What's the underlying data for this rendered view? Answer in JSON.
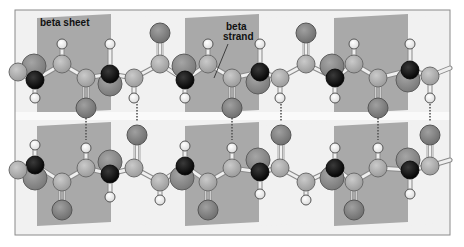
{
  "figure": {
    "labels": {
      "sheet": "beta sheet",
      "strand_line1": "beta",
      "strand_line2": "strand"
    },
    "colors": {
      "background": "#ffffff",
      "frame": "#8a8a8a",
      "panel_light": "#f1f1f1",
      "panel_dark": "#a9a9a9",
      "nitrogen": "#0d0d0d",
      "r_group": "#8e8e8e",
      "carbon": "#b4b4b4",
      "oxygen": "#8a8a8a",
      "hydrogen": "#fbfbfb",
      "bond": "#efefef",
      "hbond": "#555555"
    },
    "frame": {
      "x": 15,
      "y": 10,
      "width": 435,
      "height": 225
    },
    "panels": [
      {
        "x": 15,
        "y": 14,
        "w": 22,
        "h": 96,
        "shade": "light"
      },
      {
        "x": 37,
        "y": 14,
        "w": 74,
        "h": 96,
        "shade": "dark"
      },
      {
        "x": 111,
        "y": 14,
        "w": 74,
        "h": 96,
        "shade": "light"
      },
      {
        "x": 185,
        "y": 14,
        "w": 74,
        "h": 96,
        "shade": "dark"
      },
      {
        "x": 259,
        "y": 14,
        "w": 75,
        "h": 96,
        "shade": "light"
      },
      {
        "x": 334,
        "y": 14,
        "w": 74,
        "h": 96,
        "shade": "dark"
      },
      {
        "x": 408,
        "y": 14,
        "w": 42,
        "h": 96,
        "shade": "light"
      },
      {
        "x": 15,
        "y": 122,
        "w": 22,
        "h": 100,
        "shade": "light"
      },
      {
        "x": 37,
        "y": 122,
        "w": 74,
        "h": 100,
        "shade": "dark"
      },
      {
        "x": 111,
        "y": 122,
        "w": 74,
        "h": 100,
        "shade": "light"
      },
      {
        "x": 185,
        "y": 122,
        "w": 74,
        "h": 100,
        "shade": "dark"
      },
      {
        "x": 259,
        "y": 122,
        "w": 75,
        "h": 100,
        "shade": "light"
      },
      {
        "x": 334,
        "y": 122,
        "w": 74,
        "h": 100,
        "shade": "dark"
      },
      {
        "x": 408,
        "y": 122,
        "w": 42,
        "h": 100,
        "shade": "light"
      }
    ],
    "strands": [
      {
        "name": "top-strand",
        "backbone": [
          [
            15,
            72
          ],
          [
            35,
            80
          ],
          [
            62,
            64
          ],
          [
            86,
            78
          ],
          [
            110,
            74
          ],
          [
            134,
            78
          ],
          [
            160,
            64
          ],
          [
            185,
            80
          ],
          [
            208,
            64
          ],
          [
            232,
            78
          ],
          [
            260,
            72
          ],
          [
            280,
            78
          ],
          [
            306,
            64
          ],
          [
            335,
            78
          ],
          [
            354,
            64
          ],
          [
            378,
            78
          ],
          [
            410,
            70
          ],
          [
            430,
            76
          ],
          [
            450,
            68
          ]
        ],
        "nitrogens": [
          [
            35,
            80
          ],
          [
            110,
            74
          ],
          [
            185,
            80
          ],
          [
            260,
            72
          ],
          [
            335,
            78
          ],
          [
            410,
            70
          ]
        ],
        "r_groups": [
          [
            34,
            66
          ],
          [
            110,
            84
          ],
          [
            184,
            66
          ],
          [
            258,
            82
          ],
          [
            332,
            66
          ],
          [
            408,
            80
          ]
        ],
        "carbons": [
          [
            18,
            72
          ],
          [
            62,
            64
          ],
          [
            86,
            78
          ],
          [
            134,
            78
          ],
          [
            160,
            64
          ],
          [
            208,
            64
          ],
          [
            232,
            78
          ],
          [
            280,
            78
          ],
          [
            306,
            64
          ],
          [
            354,
            64
          ],
          [
            378,
            78
          ],
          [
            430,
            76
          ]
        ],
        "oxygens": [
          [
            160,
            33,
            160,
            64
          ],
          [
            306,
            33,
            306,
            64
          ],
          [
            86,
            108,
            86,
            78
          ],
          [
            232,
            108,
            232,
            78
          ],
          [
            378,
            108,
            378,
            78
          ]
        ],
        "hydrogens": [
          [
            62,
            44,
            62,
            64
          ],
          [
            110,
            44,
            110,
            74
          ],
          [
            208,
            44,
            208,
            64
          ],
          [
            260,
            44,
            260,
            72
          ],
          [
            354,
            44,
            354,
            64
          ],
          [
            410,
            44,
            410,
            70
          ],
          [
            35,
            98,
            35,
            80
          ],
          [
            134,
            98,
            134,
            78
          ],
          [
            185,
            98,
            185,
            80
          ],
          [
            280,
            98,
            280,
            78
          ],
          [
            335,
            98,
            335,
            78
          ],
          [
            430,
            98,
            430,
            76
          ]
        ]
      },
      {
        "name": "bottom-strand",
        "backbone": [
          [
            15,
            170
          ],
          [
            35,
            165
          ],
          [
            62,
            182
          ],
          [
            86,
            168
          ],
          [
            110,
            174
          ],
          [
            134,
            168
          ],
          [
            160,
            182
          ],
          [
            185,
            166
          ],
          [
            208,
            182
          ],
          [
            232,
            168
          ],
          [
            260,
            172
          ],
          [
            280,
            168
          ],
          [
            306,
            182
          ],
          [
            335,
            168
          ],
          [
            354,
            182
          ],
          [
            378,
            168
          ],
          [
            410,
            170
          ],
          [
            430,
            166
          ],
          [
            450,
            160
          ]
        ],
        "nitrogens": [
          [
            35,
            165
          ],
          [
            110,
            174
          ],
          [
            185,
            166
          ],
          [
            260,
            172
          ],
          [
            335,
            168
          ],
          [
            410,
            170
          ]
        ],
        "r_groups": [
          [
            35,
            178
          ],
          [
            110,
            162
          ],
          [
            182,
            178
          ],
          [
            258,
            160
          ],
          [
            332,
            178
          ],
          [
            408,
            160
          ]
        ],
        "carbons": [
          [
            18,
            170
          ],
          [
            62,
            182
          ],
          [
            86,
            168
          ],
          [
            134,
            168
          ],
          [
            160,
            182
          ],
          [
            208,
            182
          ],
          [
            232,
            168
          ],
          [
            280,
            168
          ],
          [
            306,
            182
          ],
          [
            354,
            182
          ],
          [
            378,
            168
          ],
          [
            430,
            166
          ]
        ],
        "oxygens": [
          [
            62,
            210,
            62,
            182
          ],
          [
            208,
            210,
            208,
            182
          ],
          [
            354,
            210,
            354,
            182
          ],
          [
            137,
            135,
            137,
            168
          ],
          [
            281,
            135,
            281,
            168
          ],
          [
            430,
            135,
            430,
            166
          ]
        ],
        "hydrogens": [
          [
            35,
            145,
            35,
            165
          ],
          [
            86,
            148,
            86,
            168
          ],
          [
            185,
            146,
            185,
            166
          ],
          [
            232,
            148,
            232,
            168
          ],
          [
            335,
            148,
            335,
            168
          ],
          [
            378,
            148,
            378,
            168
          ],
          [
            110,
            197,
            110,
            174
          ],
          [
            160,
            200,
            160,
            182
          ],
          [
            260,
            194,
            260,
            172
          ],
          [
            306,
            200,
            306,
            182
          ],
          [
            410,
            194,
            410,
            170
          ]
        ]
      }
    ],
    "hydrogen_bonds": [
      [
        86,
        118,
        86,
        140
      ],
      [
        137,
        98,
        137,
        122
      ],
      [
        232,
        118,
        232,
        140
      ],
      [
        281,
        98,
        281,
        122
      ],
      [
        378,
        118,
        378,
        140
      ],
      [
        430,
        98,
        430,
        122
      ]
    ],
    "pointer_line": [
      228,
      44,
      214,
      78
    ]
  }
}
